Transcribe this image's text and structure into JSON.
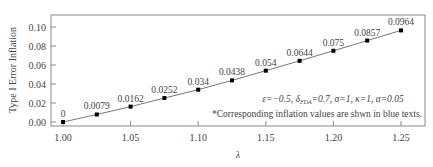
{
  "chart_data": {
    "type": "line",
    "title": "",
    "xlabel": "λ",
    "ylabel": "Type I Error Inflation",
    "x": [
      1.0,
      1.025,
      1.05,
      1.075,
      1.1,
      1.125,
      1.15,
      1.175,
      1.2,
      1.225,
      1.25
    ],
    "series": [
      {
        "name": "Type I Error Inflation",
        "values": [
          0,
          0.0079,
          0.0162,
          0.0252,
          0.034,
          0.0438,
          0.054,
          0.0644,
          0.075,
          0.0857,
          0.0964
        ],
        "labels": [
          "0",
          "0.0079",
          "0.0162",
          "0.0252",
          "0.034",
          "0.0438",
          "0.054",
          "0.0644",
          "0.075",
          "0.0857",
          "0.0964"
        ],
        "marker": "square",
        "color": "#000000"
      }
    ],
    "xlim": [
      0.985,
      1.26
    ],
    "ylim": [
      -0.004,
      0.113
    ],
    "xticks": [
      1.0,
      1.05,
      1.1,
      1.15,
      1.2,
      1.25
    ],
    "xtick_labels": [
      "1.00",
      "1.05",
      "1.10",
      "1.15",
      "1.20",
      "1.25"
    ],
    "yticks": [
      0.0,
      0.02,
      0.04,
      0.06,
      0.08,
      0.1
    ],
    "ytick_labels": [
      "0.00",
      "0.02",
      "0.04",
      "0.06",
      "0.08",
      "0.10"
    ],
    "grid": false,
    "legend": null,
    "annotations": [
      "ε=−0.5, δ_FDA=0.7, σ=1, κ=1, α=0.05",
      "*Corresponding inflation values are shwn in blue texts."
    ]
  },
  "annotation": {
    "params_prefix": "ε=−0.5, δ",
    "params_sub": "FDA",
    "params_suffix": "=0.7, σ=1, κ=1, α=0.05",
    "note": "*Corresponding inflation values are shwn in blue texts."
  }
}
